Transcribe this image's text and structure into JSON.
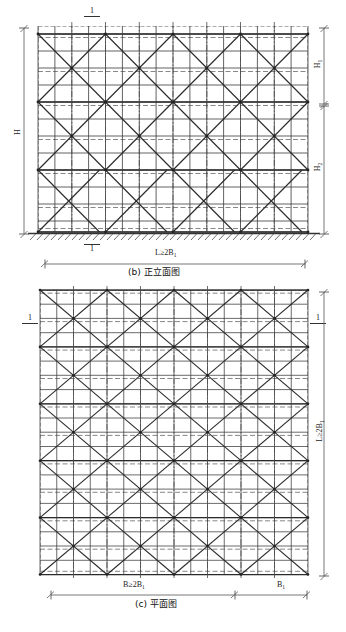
{
  "drawing": {
    "title_b": "(b) 正立面图",
    "title_c": "(c) 平面图",
    "elevation": {
      "dim_left": "H",
      "dim_right_upper": "H",
      "dim_right_upper_sub": "1",
      "dim_right_lower": "H",
      "dim_right_lower_sub": "2",
      "dim_bottom": "L≥2B",
      "dim_bottom_sub": "1",
      "section_top": "1",
      "section_bottom": "1",
      "bays_x": 8,
      "rows_total": 12,
      "rows_upper": 4,
      "rows_lower": 8,
      "brace_bays": 4
    },
    "plan": {
      "dim_right": "L≥2B",
      "dim_right_sub": "1",
      "dim_bottom_left": "B≥2B",
      "dim_bottom_left_sub": "1",
      "dim_bottom_right": "B",
      "dim_bottom_right_sub": "1",
      "section_left": "1",
      "section_right": "1",
      "cols": 8,
      "rows": 10,
      "brace_cells_x": 4,
      "brace_cells_y": 5
    },
    "colors": {
      "line_solid": "#3a3a3a",
      "line_dashed": "#4a4a4a",
      "line_brace": "#2b2b2b",
      "line_dim": "#555555",
      "line_light": "#9a9a9a",
      "ground": "#333333"
    }
  }
}
